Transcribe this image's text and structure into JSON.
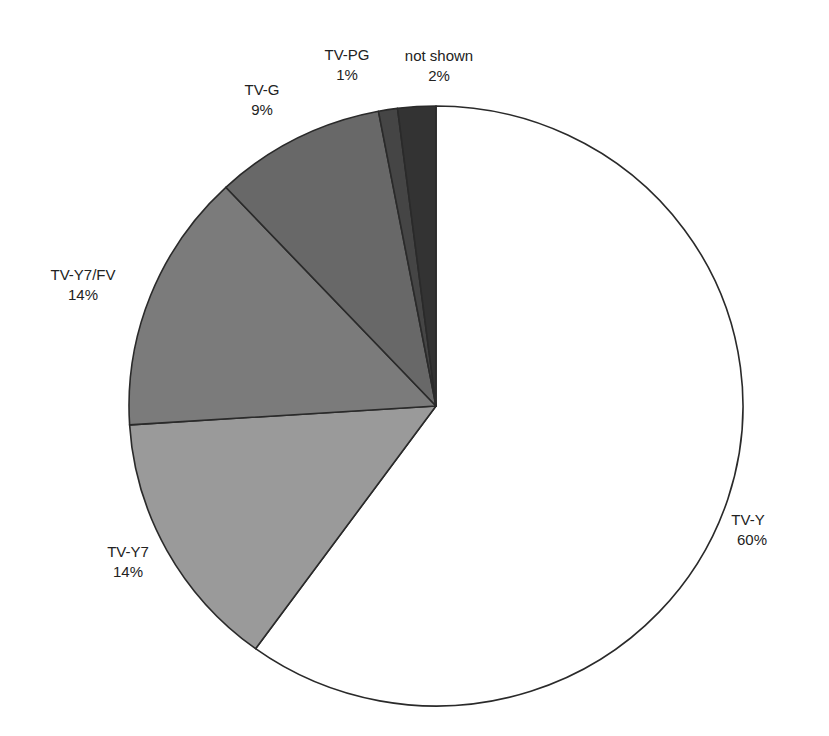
{
  "chart_data": {
    "type": "pie",
    "title": "",
    "categories": [
      "TV-Y",
      "TV-Y7",
      "TV-Y7/FV",
      "TV-G",
      "TV-PG",
      "not shown"
    ],
    "values": [
      60,
      14,
      14,
      9,
      1,
      2
    ],
    "unit": "%",
    "colors": [
      "#ffffff",
      "#9a9a9a",
      "#7b7b7b",
      "#686868",
      "#454545",
      "#333333"
    ],
    "start_angle_deg": 0,
    "direction": "clockwise",
    "labels": [
      {
        "name": "TV-Y",
        "pct": "60%"
      },
      {
        "name": "TV-Y7",
        "pct": "14%"
      },
      {
        "name": "TV-Y7/FV",
        "pct": "14%"
      },
      {
        "name": "TV-G",
        "pct": "9%"
      },
      {
        "name": "TV-PG",
        "pct": "1%"
      },
      {
        "name": "not shown",
        "pct": "2%"
      }
    ],
    "legend": "none (labels placed outside slices)"
  }
}
